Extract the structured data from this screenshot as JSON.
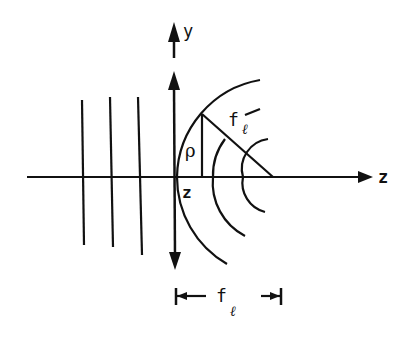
{
  "diagram": {
    "labels": {
      "y_axis": "y",
      "z_axis": "z",
      "lens_position": "z",
      "radius": "ρ",
      "focal_length_symbol": "f",
      "focal_length_subscript": "ℓ",
      "slant_symbol": "f",
      "slant_subscript": "ℓ"
    },
    "colors": {
      "stroke": "#111111",
      "background": "#ffffff"
    },
    "elements": {
      "incoming_wavefronts": 3,
      "outgoing_wavefronts": 3,
      "lens": "thin lens (double-headed arrow)",
      "dimension": "focal length f_ℓ from lens to focus"
    }
  }
}
